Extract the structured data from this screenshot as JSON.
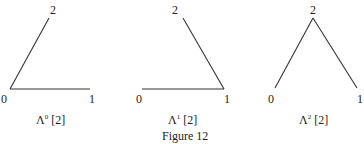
{
  "figure": {
    "caption": "Figure 12",
    "line_color": "#333333",
    "panels": [
      {
        "name": "Λ0 [2]",
        "caption_base": "Λ",
        "caption_sup": "0",
        "caption_arg": " [2]",
        "vertices": {
          "v0": "0",
          "v1": "1",
          "v2": "2"
        },
        "edges": [
          [
            "0",
            "1"
          ],
          [
            "0",
            "2"
          ]
        ]
      },
      {
        "name": "Λ1 [2]",
        "caption_base": "Λ",
        "caption_sup": "1",
        "caption_arg": " [2]",
        "vertices": {
          "v0": "0",
          "v1": "1",
          "v2": "2"
        },
        "edges": [
          [
            "0",
            "1"
          ],
          [
            "1",
            "2"
          ]
        ]
      },
      {
        "name": "Λ2 [2]",
        "caption_base": "Λ",
        "caption_sup": "2",
        "caption_arg": " [2]",
        "vertices": {
          "v0": "0",
          "v1": "1",
          "v2": "2"
        },
        "edges": [
          [
            "0",
            "2"
          ],
          [
            "1",
            "2"
          ]
        ]
      }
    ]
  }
}
